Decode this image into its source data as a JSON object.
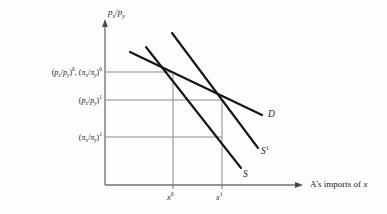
{
  "figure": {
    "background_color": "#fdfdfd",
    "axis_color": "#6f6f6f",
    "grid_color": "#8a8a8a",
    "curve_color": "#151515",
    "text_color": "#1a1a1a"
  },
  "axes": {
    "y_axis_title": "pₓ/pᵧ",
    "y_axis_title_parts": {
      "p": "p",
      "sub_x": "x",
      "slash": "/",
      "p2": "p",
      "sub_y": "y"
    },
    "x_axis_title": "A's imports of x",
    "x_axis_title_plain": "A's imports of",
    "x_axis_title_italic": "x",
    "origin_px": [
      105,
      185
    ],
    "y_top_px": 22,
    "x_right_px": 300
  },
  "y_ticks": [
    {
      "id": "level-0",
      "label": "(pₓ/pᵧ)⁰, (πₓ/πᵧ)⁰",
      "y_px": 72,
      "grid_extends_to_px": 173
    },
    {
      "id": "level-1-p",
      "label": "(pₓ/pᵧ)¹",
      "y_px": 100,
      "grid_extends_to_px": 222
    },
    {
      "id": "level-1-pi",
      "label": "(πₓ/πᵧ)¹",
      "y_px": 137,
      "grid_extends_to_px": 222
    }
  ],
  "x_ticks": [
    {
      "id": "x0",
      "label": "x⁰",
      "base": "x",
      "exp": "0",
      "x_px": 173
    },
    {
      "id": "x1",
      "label": "x¹",
      "base": "x",
      "exp": "1",
      "x_px": 222
    }
  ],
  "curves": [
    {
      "id": "demand",
      "label": "D",
      "base": "D",
      "exp": "",
      "start_px": [
        130,
        52
      ],
      "end_px": [
        262,
        115
      ],
      "label_px": [
        268,
        112
      ]
    },
    {
      "id": "supply-original",
      "label": "S",
      "base": "S",
      "exp": "",
      "start_px": [
        146,
        47
      ],
      "end_px": [
        241,
        168
      ],
      "label_px": [
        243,
        172
      ]
    },
    {
      "id": "supply-shifted",
      "label": "S¹",
      "base": "S",
      "exp": "1",
      "start_px": [
        172,
        33
      ],
      "end_px": [
        258,
        148
      ],
      "label_px": [
        261,
        149
      ]
    }
  ],
  "equilibria": [
    {
      "id": "eq-0",
      "x_px": 173,
      "y_px": 72,
      "description": "D meets S and S¹ at x⁰"
    },
    {
      "id": "eq-1",
      "x_px": 222,
      "y_px": 100,
      "description": "D meets S¹ at x¹"
    }
  ]
}
